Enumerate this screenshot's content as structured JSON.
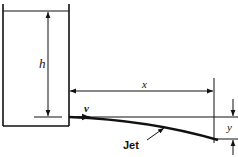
{
  "diagram": {
    "labels": {
      "height": "h",
      "horizontal_distance": "x",
      "velocity": "v",
      "vertical_drop": "y",
      "jet": "Jet"
    },
    "colors": {
      "line": "#111111",
      "background": "#ffffff"
    }
  }
}
